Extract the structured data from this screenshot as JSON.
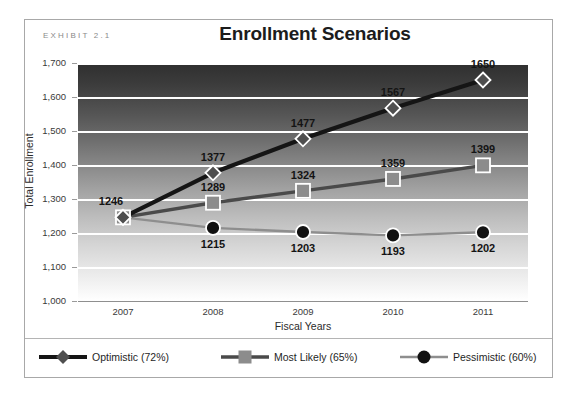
{
  "exhibit": {
    "label": "EXHIBIT 2.1"
  },
  "chart_data": {
    "type": "line",
    "title": "Enrollment Scenarios",
    "xlabel": "Fiscal Years",
    "ylabel": "Total Enrollment",
    "categories": [
      "2007",
      "2008",
      "2009",
      "2010",
      "2011"
    ],
    "ylim": [
      1000,
      1700
    ],
    "yticks": [
      "1,000",
      "1,100",
      "1,200",
      "1,300",
      "1,400",
      "1,500",
      "1,600",
      "1,700"
    ],
    "ytick_values": [
      1000,
      1100,
      1200,
      1300,
      1400,
      1500,
      1600,
      1700
    ],
    "grid": true,
    "legend_position": "bottom",
    "series": [
      {
        "name": "Optimistic (72%)",
        "marker": "diamond",
        "color": "#151515",
        "marker_color": "#4f4f4f",
        "values": [
          1246,
          1377,
          1477,
          1567,
          1650
        ],
        "labels": [
          "1246",
          "1377",
          "1477",
          "1567",
          "1650"
        ]
      },
      {
        "name": "Most Likely (65%)",
        "marker": "square",
        "color": "#4a4a4a",
        "marker_color": "#8c8c8c",
        "values": [
          1246,
          1289,
          1324,
          1359,
          1399
        ],
        "labels": [
          "1246",
          "1289",
          "1324",
          "1359",
          "1399"
        ]
      },
      {
        "name": "Pessimistic (60%)",
        "marker": "circle",
        "color": "#8e8e8e",
        "marker_color": "#121212",
        "values": [
          1246,
          1215,
          1203,
          1193,
          1202
        ],
        "labels": [
          "1246",
          "1215",
          "1203",
          "1193",
          "1202"
        ]
      }
    ]
  },
  "legend": [
    {
      "label": "Optimistic (72%)"
    },
    {
      "label": "Most Likely (65%)"
    },
    {
      "label": "Pessimistic (60%)"
    }
  ]
}
